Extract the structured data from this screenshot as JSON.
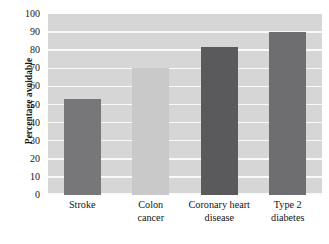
{
  "chart_data": {
    "type": "bar",
    "title": "",
    "subtitle": "",
    "xlabel": "",
    "ylabel": "Percentage avoidable",
    "categories": [
      "Stroke",
      "Colon cancer",
      "Coronary heart disease",
      "Type 2 diabetes"
    ],
    "category_lines": [
      [
        "Stroke"
      ],
      [
        "Colon",
        "cancer"
      ],
      [
        "Coronary heart",
        "disease"
      ],
      [
        "Type 2",
        "diabetes"
      ]
    ],
    "values": [
      53,
      70,
      82,
      90
    ],
    "bar_colors": [
      "#77777a",
      "#c9c9c9",
      "#5a5a5c",
      "#6e6e70"
    ],
    "ylim": [
      0,
      100
    ],
    "ytick_step": 10,
    "yticks": [
      100,
      90,
      80,
      70,
      60,
      50,
      40,
      30,
      20,
      10,
      0
    ],
    "ytick_labels": [
      "100",
      "90",
      "80",
      "70",
      "60",
      "50",
      "40",
      "30",
      "20",
      "10",
      "0"
    ],
    "grid": true,
    "grid_axis": "y",
    "grid_color": "#fafafa",
    "legend": false,
    "legend_position": "none",
    "plot_background": "#d6d6d6",
    "figure_background": "#ffffff",
    "text_color": "#141414"
  }
}
